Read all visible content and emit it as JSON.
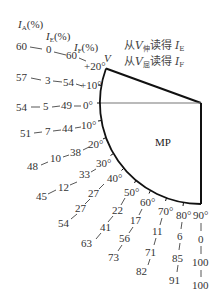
{
  "headers": {
    "ia": {
      "main": "I",
      "sub": "A",
      "unit": "(%)"
    },
    "ie": {
      "main": "I",
      "sub": "E",
      "unit": "(%)"
    },
    "if": {
      "main": "I",
      "sub": "F",
      "unit": "(%)"
    }
  },
  "v_label": "V",
  "notes": [
    {
      "prefix": "从",
      "var": "V",
      "var_sub": "伸",
      "suffix": "读得",
      "target": "I",
      "target_sub": "E"
    },
    {
      "prefix": "从",
      "var": "V",
      "var_sub": "屈",
      "suffix": "读得",
      "target": "I",
      "target_sub": "F"
    }
  ],
  "region_label": "MP",
  "rows_left": [
    {
      "angle": "+20°",
      "ia": "60",
      "ie": "0",
      "if": "60"
    },
    {
      "angle": "+10°",
      "ia": "57",
      "ie": "3",
      "if": "54"
    },
    {
      "angle": "0°",
      "ia": "54",
      "ie": "5",
      "if": "49"
    },
    {
      "angle": "10°",
      "ia": "51",
      "ie": "7",
      "if": "44"
    },
    {
      "angle": "20°",
      "ia": "48",
      "ie": "10",
      "if": "38"
    },
    {
      "angle": "30°",
      "ia": "45",
      "ie": "12",
      "if": "33"
    }
  ],
  "rows_radial": [
    {
      "angle": "40°",
      "if": "27",
      "ie": "27",
      "ia": "54"
    },
    {
      "angle": "50°",
      "if": "22",
      "ie": "41",
      "ia": "63"
    },
    {
      "angle": "60°",
      "if": "17",
      "ie": "56",
      "ia": "73"
    },
    {
      "angle": "70°",
      "if": "11",
      "ie": "71",
      "ia": "82"
    },
    {
      "angle": "80°",
      "if": "6",
      "ie": "85",
      "ia": "91"
    },
    {
      "angle": "90°",
      "if": "0",
      "ie": "100",
      "ia": "100"
    }
  ],
  "colors": {
    "line": "#111111",
    "text": "#333333",
    "horizontal": "#777777"
  }
}
